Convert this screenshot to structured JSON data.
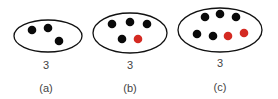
{
  "colors": {
    "outline": "#111111",
    "dot_black": "#0a0a0a",
    "dot_red": "#d42a22",
    "text": "#444444"
  },
  "panels": [
    {
      "id": "a",
      "count_label": "3",
      "caption": "(a)",
      "ellipse": {
        "cx": 48,
        "cy": 36,
        "rx": 34,
        "ry": 16
      },
      "dots": [
        {
          "x": 32,
          "y": 30,
          "color": "black"
        },
        {
          "x": 48,
          "y": 28,
          "color": "black"
        },
        {
          "x": 59,
          "y": 41,
          "color": "black"
        }
      ],
      "label_x": 46,
      "count_y": 60,
      "caption_y": 83
    },
    {
      "id": "b",
      "count_label": "3",
      "caption": "(b)",
      "ellipse": {
        "cx": 130,
        "cy": 33,
        "rx": 37,
        "ry": 20
      },
      "dots": [
        {
          "x": 112,
          "y": 24,
          "color": "black"
        },
        {
          "x": 130,
          "y": 22,
          "color": "black"
        },
        {
          "x": 147,
          "y": 24,
          "color": "black"
        },
        {
          "x": 122,
          "y": 39,
          "color": "black"
        },
        {
          "x": 138,
          "y": 39,
          "color": "red"
        }
      ],
      "label_x": 130,
      "count_y": 60,
      "caption_y": 83
    },
    {
      "id": "c",
      "count_label": "3",
      "caption": "(c)",
      "ellipse": {
        "cx": 220,
        "cy": 30,
        "rx": 42,
        "ry": 22
      },
      "dots": [
        {
          "x": 205,
          "y": 17,
          "color": "black"
        },
        {
          "x": 220,
          "y": 14,
          "color": "black"
        },
        {
          "x": 236,
          "y": 17,
          "color": "black"
        },
        {
          "x": 197,
          "y": 34,
          "color": "black"
        },
        {
          "x": 213,
          "y": 36,
          "color": "black"
        },
        {
          "x": 228,
          "y": 36,
          "color": "red"
        },
        {
          "x": 244,
          "y": 33,
          "color": "red"
        }
      ],
      "label_x": 220,
      "count_y": 58,
      "caption_y": 82
    }
  ]
}
